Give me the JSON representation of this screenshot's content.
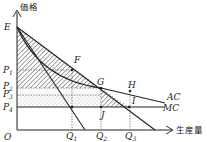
{
  "diagram": {
    "type": "monopoly-pricing-economics-diagram",
    "axes": {
      "y_label": "価格",
      "x_label": "生産量",
      "origin_label": "O"
    },
    "price_labels": [
      {
        "id": "P1",
        "main": "P",
        "sub": "1"
      },
      {
        "id": "P2",
        "main": "P",
        "sub": "2"
      },
      {
        "id": "P3",
        "main": "P",
        "sub": "3"
      },
      {
        "id": "P4",
        "main": "P",
        "sub": "4"
      }
    ],
    "quantity_labels": [
      {
        "id": "Q1",
        "main": "Q",
        "sub": "1"
      },
      {
        "id": "Q2",
        "main": "Q",
        "sub": "2"
      },
      {
        "id": "Q3",
        "main": "Q",
        "sub": "3"
      }
    ],
    "points": {
      "E": "E",
      "F": "F",
      "G": "G",
      "H": "H",
      "I": "I",
      "J": "J"
    },
    "curves": {
      "AC": "AC",
      "MC": "MC"
    },
    "colors": {
      "line": "#222222",
      "hatch": "#333333",
      "dots": "#555555",
      "background": "#ffffff"
    }
  }
}
